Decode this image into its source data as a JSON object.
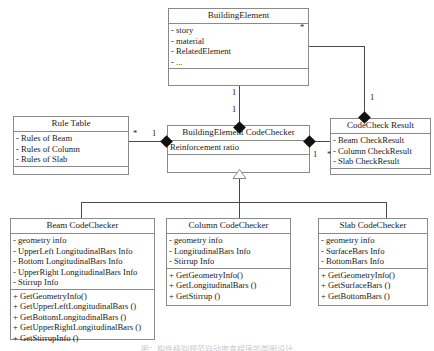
{
  "diagram": {
    "type": "uml-class-diagram",
    "caption": "图：构件级别规范自动审查程序的类图设计",
    "classes": [
      {
        "id": "building-element",
        "name": "BuildingElement",
        "attributes": [
          "- story",
          "- material",
          "- RelatedElement",
          "- ..."
        ],
        "operations": []
      },
      {
        "id": "rule-table",
        "name": "Rule Table",
        "attributes": [
          "- Rules of Beam",
          "- Rules of Column",
          "- Rules of Slab"
        ],
        "operations": []
      },
      {
        "id": "building-element-codechecker",
        "name": "BuildingElement CodeChecker",
        "attributes": [
          "Reinforcement ratio"
        ],
        "operations": []
      },
      {
        "id": "codecheck-result",
        "name": "CodeCheck Result",
        "attributes": [
          "- Beam CheckResult",
          "- Column CheckResult",
          "- Slab CheckResult"
        ],
        "operations": []
      },
      {
        "id": "beam-codechecker",
        "name": "Beam CodeChecker",
        "attributes": [
          "- geometry info",
          "- UpperLeft LongitudinalBars Info",
          "- Bottom LongitudinalBars Info",
          "- UpperRight LongitudinalBars Info",
          "- Stirrup Info"
        ],
        "operations": [
          "+ GetGeometryInfo()",
          "+ GetUpperLeftLongitudinalBars ()",
          "+ GetBottomLongitudinalBars ()",
          "+ GetUpperRightLongitudinalBars ()",
          "+ GetStirrupInfo ()"
        ]
      },
      {
        "id": "column-codechecker",
        "name": "Column CodeChecker",
        "attributes": [
          "- geometry info",
          "- LongitudinalBars Info",
          "- Stirrup Info"
        ],
        "operations": [
          "+ GetGeometryInfo()",
          "+ GetLongitudinalBars ()",
          "+ GetStirrup ()"
        ]
      },
      {
        "id": "slab-codechecker",
        "name": "Slab CodeChecker",
        "attributes": [
          "- geometry info",
          "- SurfaceBars Info",
          "- BottomBars Info"
        ],
        "operations": [
          "+ GetGeometryInfo()",
          "+ GetSurfaceBars ()",
          "+ GetBottomBars ()"
        ]
      }
    ],
    "multiplicities": {
      "building_element_right_star": "*",
      "codecheck_result_top_one": "1",
      "building_element_bottom_one": "1",
      "codechecker_top_one": "1",
      "rule_table_star": "*",
      "codechecker_left_one": "1",
      "codechecker_right_one": "1",
      "codecheck_result_left_star": "*"
    },
    "colors": {
      "border": "#8a8a8a",
      "edge": "#4a4a4a",
      "text": "#1a1a1a",
      "background": "#ffffff"
    }
  }
}
